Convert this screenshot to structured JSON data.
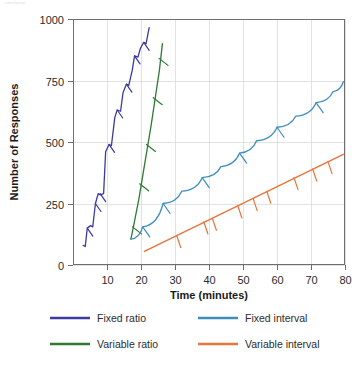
{
  "caption": {
    "top_faint_text": "cumulative"
  },
  "chart_data": {
    "type": "line",
    "title": "",
    "xlabel": "Time (minutes)",
    "ylabel": "Number of Responses",
    "xlim": [
      0,
      80
    ],
    "ylim": [
      0,
      1000
    ],
    "xticks": [
      10,
      20,
      30,
      40,
      50,
      60,
      70,
      80
    ],
    "yticks": [
      0,
      250,
      500,
      750,
      1000
    ],
    "grid": "vertical-and-horizontal-light",
    "legend_position": "below-plot-two-columns",
    "series": [
      {
        "name": "Fixed ratio",
        "color": "#3b3ba0",
        "style": "stepped-with-post-reinforcement-pauses",
        "x": [
          3.0,
          3.6,
          4.2,
          5.2,
          5.8,
          6.6,
          7.4,
          8.0,
          9.0,
          9.6,
          10.6,
          11.3,
          12.3,
          13.0,
          14.0,
          14.7,
          15.7,
          16.4,
          17.4,
          18.1,
          19.1,
          19.8,
          20.8,
          21.5,
          22.4
        ],
        "y": [
          80,
          75,
          150,
          160,
          155,
          250,
          290,
          285,
          290,
          460,
          490,
          485,
          600,
          630,
          625,
          700,
          735,
          730,
          790,
          850,
          845,
          880,
          905,
          900,
          965
        ],
        "reinforcement_marks": [
          {
            "x": 4.2,
            "y": 150
          },
          {
            "x": 6.6,
            "y": 250
          },
          {
            "x": 8.0,
            "y": 290
          },
          {
            "x": 10.6,
            "y": 490
          },
          {
            "x": 13.0,
            "y": 630
          },
          {
            "x": 15.7,
            "y": 735
          },
          {
            "x": 18.1,
            "y": 850
          },
          {
            "x": 20.8,
            "y": 905
          }
        ]
      },
      {
        "name": "Variable ratio",
        "color": "#2d7a33",
        "style": "steep-straight-high-rate",
        "x": [
          17.0,
          17.4,
          18.2,
          19.4,
          20.6,
          21.8,
          23.0,
          24.2,
          25.4,
          26.3
        ],
        "y": [
          105,
          130,
          185,
          270,
          370,
          470,
          570,
          680,
          790,
          900
        ],
        "reinforcement_marks": [
          {
            "x": 17.5,
            "y": 155
          },
          {
            "x": 19.6,
            "y": 330
          },
          {
            "x": 21.6,
            "y": 490
          },
          {
            "x": 23.6,
            "y": 680
          },
          {
            "x": 25.3,
            "y": 840
          }
        ]
      },
      {
        "name": "Fixed interval",
        "color": "#3c8dc0",
        "style": "scalloped",
        "scallop_peaks": [
          {
            "x": 17.0,
            "y": 105
          },
          {
            "x": 20.5,
            "y": 155
          },
          {
            "x": 26.5,
            "y": 250
          },
          {
            "x": 32.0,
            "y": 300
          },
          {
            "x": 38.0,
            "y": 355
          },
          {
            "x": 43.5,
            "y": 400
          },
          {
            "x": 49.0,
            "y": 455
          },
          {
            "x": 54.0,
            "y": 505
          },
          {
            "x": 60.0,
            "y": 560
          },
          {
            "x": 65.5,
            "y": 605
          },
          {
            "x": 71.5,
            "y": 660
          },
          {
            "x": 76.5,
            "y": 705
          },
          {
            "x": 79.5,
            "y": 745
          }
        ],
        "reinforcement_marks": [
          {
            "x": 20.5,
            "y": 155
          },
          {
            "x": 26.5,
            "y": 250
          },
          {
            "x": 38.0,
            "y": 355
          },
          {
            "x": 49.0,
            "y": 455
          },
          {
            "x": 60.0,
            "y": 560
          },
          {
            "x": 71.5,
            "y": 660
          }
        ]
      },
      {
        "name": "Variable interval",
        "color": "#e8743b",
        "style": "straight-steady-low-rate",
        "x": [
          21.0,
          79.5
        ],
        "y": [
          55,
          450
        ],
        "reinforcement_marks": [
          {
            "x": 30.5,
            "y": 120
          },
          {
            "x": 38.5,
            "y": 175
          },
          {
            "x": 41.0,
            "y": 190
          },
          {
            "x": 48.5,
            "y": 240
          },
          {
            "x": 53.0,
            "y": 270
          },
          {
            "x": 57.0,
            "y": 300
          },
          {
            "x": 65.0,
            "y": 355
          },
          {
            "x": 70.5,
            "y": 390
          },
          {
            "x": 75.0,
            "y": 420
          }
        ]
      }
    ]
  },
  "legend": {
    "entries": [
      {
        "label": "Fixed ratio",
        "color": "#3b3ba0"
      },
      {
        "label": "Fixed interval",
        "color": "#3c8dc0"
      },
      {
        "label": "Variable ratio",
        "color": "#2d7a33"
      },
      {
        "label": "Variable interval",
        "color": "#e8743b"
      }
    ]
  },
  "axes": {
    "y_title": "Number of Responses",
    "x_title": "Time (minutes)",
    "y_tick_labels": [
      "0",
      "250",
      "500",
      "750",
      "1000"
    ],
    "x_tick_labels": [
      "10",
      "20",
      "30",
      "40",
      "50",
      "60",
      "70",
      "80"
    ]
  }
}
